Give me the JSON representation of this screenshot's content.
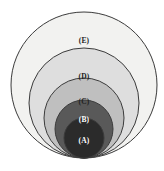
{
  "diagram": {
    "type": "nested-tangent-circles",
    "background_color": "#ffffff",
    "stroke_color": "#3b3b3b",
    "tangent_point": {
      "x": 84,
      "y": 158
    },
    "circles": [
      {
        "id": "E",
        "label": "(E)",
        "fill": "#f2f2f0",
        "label_color": "#222222",
        "cx": 84,
        "cy": 85,
        "r": 73,
        "label_x": 84,
        "label_y": 41
      },
      {
        "id": "D",
        "label": "(D)",
        "fill": "#dedede",
        "label_color": "#222222",
        "cx": 84,
        "cy": 103,
        "r": 55,
        "label_x": 84,
        "label_y": 77
      },
      {
        "id": "C",
        "label": "(C)",
        "fill": "#bfbfbf",
        "label_color": "#222222",
        "cx": 84,
        "cy": 118,
        "r": 40,
        "label_x": 84,
        "label_y": 102
      },
      {
        "id": "B",
        "label": "(B)",
        "fill": "#595959",
        "label_color": "#ffffff",
        "cx": 84,
        "cy": 129,
        "r": 29,
        "label_x": 84,
        "label_y": 120
      },
      {
        "id": "A",
        "label": "(A)",
        "fill": "#2b2b2b",
        "label_color": "#ffffff",
        "cx": 84,
        "cy": 138,
        "r": 20,
        "label_x": 84,
        "label_y": 141
      }
    ]
  }
}
